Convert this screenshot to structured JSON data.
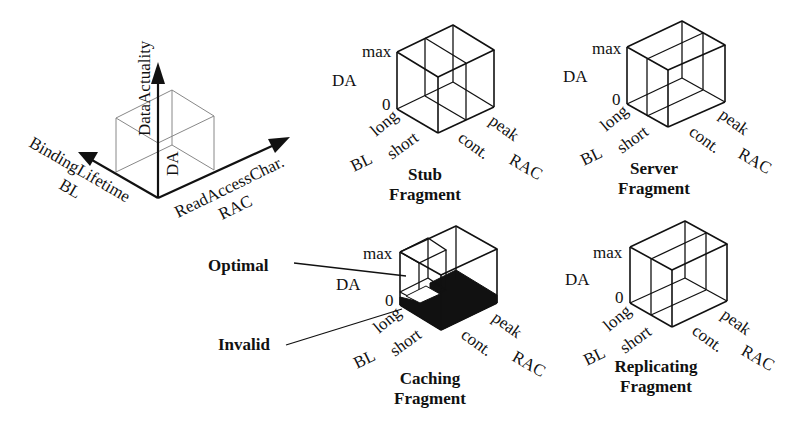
{
  "axes_legend": {
    "vertical_axis": {
      "label": "DataActuality",
      "abbrev": "DA"
    },
    "left_axis": {
      "label": "BindingLifetime",
      "abbrev": "BL"
    },
    "right_axis": {
      "label": "ReadAccessChar.",
      "abbrev": "RAC"
    }
  },
  "cube_labels": {
    "da_max": "max",
    "da_zero": "0",
    "da": "DA",
    "bl_long": "long",
    "bl_short": "short",
    "bl": "BL",
    "rac_peak": "peak",
    "rac_cont": "cont.",
    "rac": "RAC"
  },
  "fragments": [
    {
      "id": "stub",
      "title_line1": "Stub",
      "title_line2": "Fragment"
    },
    {
      "id": "server",
      "title_line1": "Server",
      "title_line2": "Fragment"
    },
    {
      "id": "caching",
      "title_line1": "Caching",
      "title_line2": "Fragment"
    },
    {
      "id": "replicating",
      "title_line1": "Replicating",
      "title_line2": "Fragment"
    }
  ],
  "annotations": {
    "optimal": "Optimal",
    "invalid": "Invalid"
  },
  "colors": {
    "line": "#111111",
    "ghost_cube": "#888888",
    "invalid_fill": "#111111",
    "background": "#ffffff"
  }
}
